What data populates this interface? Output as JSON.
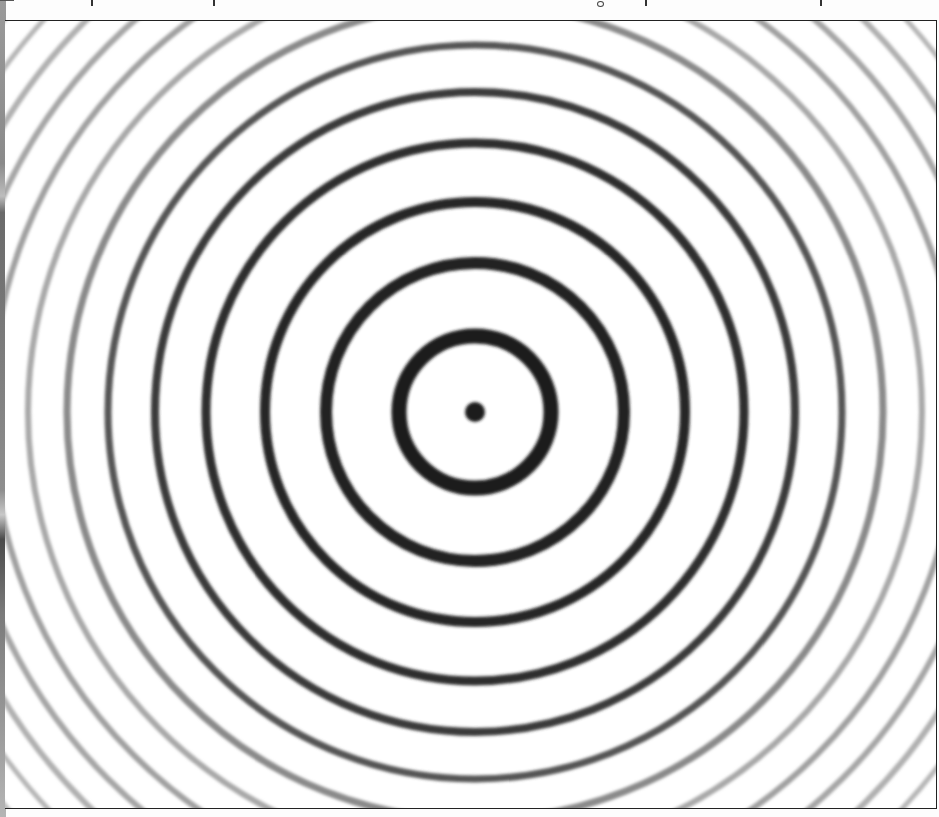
{
  "page": {
    "type": "scanned book figure",
    "top_text_line": "clipped (descenders only, unreadable)"
  },
  "figure": {
    "frame": {
      "left": 5,
      "top": 20,
      "right": 937,
      "bottom": 808,
      "border_color": "#222222"
    },
    "center": {
      "x": 475,
      "y": 411
    },
    "center_dot": {
      "radius": 10,
      "color": "#1a1a1a"
    },
    "rings": [
      {
        "r": 76,
        "width": 15,
        "color": "#1c1c1c"
      },
      {
        "r": 149,
        "width": 12,
        "color": "#222222"
      },
      {
        "r": 210,
        "width": 10,
        "color": "#262626"
      },
      {
        "r": 269,
        "width": 9,
        "color": "#2e2e2e"
      },
      {
        "r": 320,
        "width": 8,
        "color": "#3a3a3a"
      },
      {
        "r": 367,
        "width": 7,
        "color": "#555555"
      },
      {
        "r": 408,
        "width": 7,
        "color": "#8a8a8a"
      },
      {
        "r": 447,
        "width": 6,
        "color": "#a8a8a8"
      },
      {
        "r": 484,
        "width": 6,
        "color": "#a0a0a0"
      },
      {
        "r": 519,
        "width": 6,
        "color": "#a6a6a6"
      },
      {
        "r": 552,
        "width": 6,
        "color": "#b0b0b0"
      },
      {
        "r": 583,
        "width": 5,
        "color": "#b6b6b6"
      },
      {
        "r": 613,
        "width": 5,
        "color": "#bcbcbc"
      },
      {
        "r": 641,
        "width": 5,
        "color": "#c4c4c4"
      },
      {
        "r": 668,
        "width": 5,
        "color": "#cccccc"
      }
    ],
    "background_color": "#ffffff"
  }
}
